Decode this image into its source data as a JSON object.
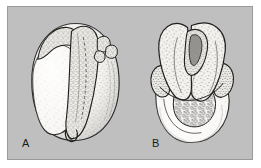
{
  "figure": {
    "type": "scientific-illustration-plate",
    "caption_labels": [
      "A",
      "B"
    ],
    "background_color": "#bfbfbf",
    "border_color": "#9a9a9a",
    "page_color": "#ffffff",
    "ink_color": "#1a1a1a",
    "fill_color": "#f2f0ec",
    "stipple_color": "#3a3a3a"
  },
  "panels": [
    {
      "id": "panel-a",
      "label": "A",
      "view": "lateral view of rounded specimen with large smooth left lobe, central ridged lobe, small budding protrusions at upper right, and a notch at the lower margin",
      "features": [
        "outer rounded body outline",
        "large smooth anterior lobe",
        "central elongate ridged lobe",
        "cluster of small rounded buds upper right",
        "ventral notch at lower margin",
        "stipple shading"
      ]
    },
    {
      "id": "panel-b",
      "label": "B",
      "view": "frontal view showing paired folded lobes forming a deep groove above, a lateral flange, and a granular cell-mass region in the lower half",
      "features": [
        "paired recurved folds forming a central slit",
        "lateral flange on right margin",
        "lateral flange on left margin",
        "granular vesicular cell mass in lower region",
        "smooth rounded basal body",
        "stipple shading"
      ]
    }
  ]
}
